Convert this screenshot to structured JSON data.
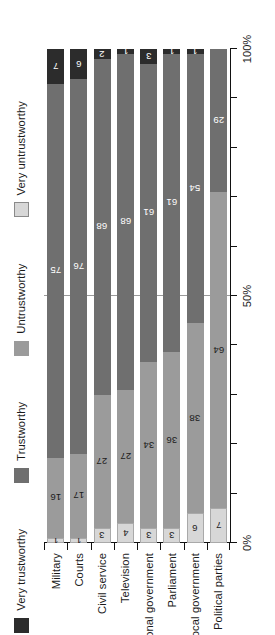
{
  "chart_data": {
    "type": "bar",
    "orientation": "horizontal-stacked",
    "title": "",
    "subtitle": "",
    "xlabel": "",
    "ylabel": "",
    "xlim": [
      0,
      100
    ],
    "grid": false,
    "legend_position": "top",
    "categories": [
      "Military",
      "Courts",
      "Civil service",
      "Television",
      "National government",
      "Parliament",
      "Local government",
      "Political parties"
    ],
    "series": [
      {
        "name": "Very untrustworthy",
        "color": "#d7d7d7",
        "values": [
          1,
          1,
          3,
          4,
          3,
          3,
          6,
          7
        ]
      },
      {
        "name": "Untrustworthy",
        "color": "#9b9b9b",
        "values": [
          16,
          17,
          27,
          27,
          34,
          36,
          38,
          64
        ]
      },
      {
        "name": "Trustworthy",
        "color": "#6f6f6f",
        "values": [
          75,
          76,
          68,
          68,
          61,
          61,
          54,
          29
        ]
      },
      {
        "name": "Very trustworthy",
        "color": "#2c2c2c",
        "values": [
          7,
          6,
          2,
          1,
          3,
          1,
          1,
          0
        ]
      }
    ],
    "axis_ticks": [
      {
        "value": 0,
        "label": "0%"
      },
      {
        "value": 10,
        "label": ""
      },
      {
        "value": 20,
        "label": ""
      },
      {
        "value": 30,
        "label": ""
      },
      {
        "value": 40,
        "label": ""
      },
      {
        "value": 50,
        "label": "50%"
      },
      {
        "value": 60,
        "label": ""
      },
      {
        "value": 70,
        "label": ""
      },
      {
        "value": 80,
        "label": ""
      },
      {
        "value": 90,
        "label": ""
      },
      {
        "value": 100,
        "label": "100%"
      }
    ]
  }
}
